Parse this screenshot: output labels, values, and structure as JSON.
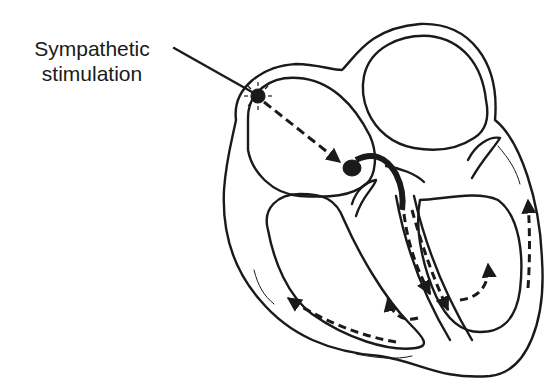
{
  "diagram": {
    "label": {
      "line1": "Sympathetic",
      "line2": "stimulation"
    },
    "colors": {
      "stroke": "#1a1a1a",
      "background": "#ffffff"
    },
    "elements": [
      "sa-node-burst",
      "internodal-pathway-arrows",
      "av-node",
      "bundle-of-his",
      "left-bundle-branch",
      "right-bundle-branch",
      "purkinje-arrows",
      "atria",
      "ventricles",
      "valve-leaflets"
    ]
  }
}
